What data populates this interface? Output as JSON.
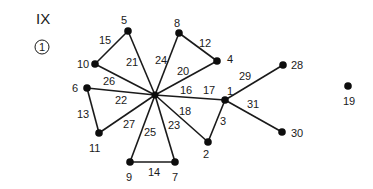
{
  "figure": {
    "roman_label": "IX",
    "circled_label": "1"
  },
  "graph": {
    "hub": {
      "x": 155,
      "y": 95
    },
    "nodes": [
      {
        "id": "1",
        "x": 225,
        "y": 100,
        "lx": 227,
        "ly": 95
      },
      {
        "id": "2",
        "x": 208,
        "y": 142,
        "lx": 203,
        "ly": 158
      },
      {
        "id": "4",
        "x": 217,
        "y": 61,
        "lx": 227,
        "ly": 63
      },
      {
        "id": "5",
        "x": 128,
        "y": 31,
        "lx": 121,
        "ly": 24
      },
      {
        "id": "6",
        "x": 87,
        "y": 88,
        "lx": 72,
        "ly": 92
      },
      {
        "id": "7",
        "x": 175,
        "y": 162,
        "lx": 172,
        "ly": 181
      },
      {
        "id": "8",
        "x": 179,
        "y": 33,
        "lx": 174,
        "ly": 27
      },
      {
        "id": "9",
        "x": 130,
        "y": 162,
        "lx": 126,
        "ly": 181
      },
      {
        "id": "10",
        "x": 95,
        "y": 64,
        "lx": 77,
        "ly": 68
      },
      {
        "id": "11",
        "x": 99,
        "y": 133,
        "lx": 89,
        "ly": 152
      },
      {
        "id": "19",
        "x": 348,
        "y": 86,
        "lx": 343,
        "ly": 105
      },
      {
        "id": "28",
        "x": 283,
        "y": 65,
        "lx": 291,
        "ly": 69
      },
      {
        "id": "30",
        "x": 282,
        "y": 132,
        "lx": 291,
        "ly": 137
      }
    ],
    "edges": [
      {
        "id": "3",
        "from": "1",
        "to": "2",
        "lx": 220,
        "ly": 125
      },
      {
        "id": "12",
        "from": "8",
        "to": "4",
        "lx": 199,
        "ly": 47
      },
      {
        "id": "13",
        "from": "6",
        "to": "11",
        "lx": 77,
        "ly": 118
      },
      {
        "id": "14",
        "from": "9",
        "to": "7",
        "lx": 148,
        "ly": 176
      },
      {
        "id": "15",
        "from": "10",
        "to": "5",
        "lx": 99,
        "ly": 44
      },
      {
        "id": "16",
        "from": "hub",
        "to": "1",
        "lx": 180,
        "ly": 94
      },
      {
        "id": "17",
        "from": "hub",
        "to": "1",
        "lx": 203,
        "ly": 94
      },
      {
        "id": "18",
        "from": "hub",
        "to": "2",
        "lx": 179,
        "ly": 115
      },
      {
        "id": "20",
        "from": "hub",
        "to": "4",
        "lx": 177,
        "ly": 75
      },
      {
        "id": "21",
        "from": "hub",
        "to": "5",
        "lx": 126,
        "ly": 66
      },
      {
        "id": "22",
        "from": "hub",
        "to": "6",
        "lx": 115,
        "ly": 104
      },
      {
        "id": "23",
        "from": "hub",
        "to": "7",
        "lx": 168,
        "ly": 129
      },
      {
        "id": "24",
        "from": "hub",
        "to": "8",
        "lx": 155,
        "ly": 64
      },
      {
        "id": "25",
        "from": "hub",
        "to": "9",
        "lx": 144,
        "ly": 136
      },
      {
        "id": "26",
        "from": "hub",
        "to": "10",
        "lx": 103,
        "ly": 85
      },
      {
        "id": "27",
        "from": "hub",
        "to": "11",
        "lx": 123,
        "ly": 128
      },
      {
        "id": "29",
        "from": "1",
        "to": "28",
        "lx": 239,
        "ly": 80
      },
      {
        "id": "31",
        "from": "1",
        "to": "30",
        "lx": 247,
        "ly": 108
      }
    ]
  }
}
